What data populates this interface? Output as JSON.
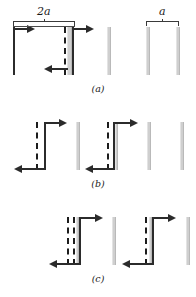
{
  "figure": {
    "type": "physics-line-diagram",
    "background_color": "#ffffff",
    "ink_color": "#2b2b2b",
    "gray_bar_color": "#cfcfcf",
    "dimension_labels": [
      {
        "text": "2a",
        "panel": "a",
        "position": "upper-left"
      },
      {
        "text": "a",
        "panel": "a",
        "position": "upper-right"
      }
    ],
    "panels": [
      {
        "id": "a",
        "caption": "(a)",
        "dimension_label_left": "2a",
        "dimension_label_right": "a",
        "elements": "two wide gray strips with black solid and dashed boundary lines, rightward arrow at top, leftward arrow at bottom"
      },
      {
        "id": "b",
        "caption": "(b)",
        "elements": "two narrower gray strips each preceded by a dashed line and a solid black line, rightward arrows at top, leftward arrows at bottom"
      },
      {
        "id": "c",
        "caption": "(c)",
        "elements": "paired dashed lines adjacent to solid black lines and gray strips, rightward arrows at top, leftward arrows at bottom"
      }
    ]
  },
  "labels": {
    "two_a": "2a",
    "a": "a",
    "caption_a": "(a)",
    "caption_b": "(b)",
    "caption_c": "(c)"
  }
}
